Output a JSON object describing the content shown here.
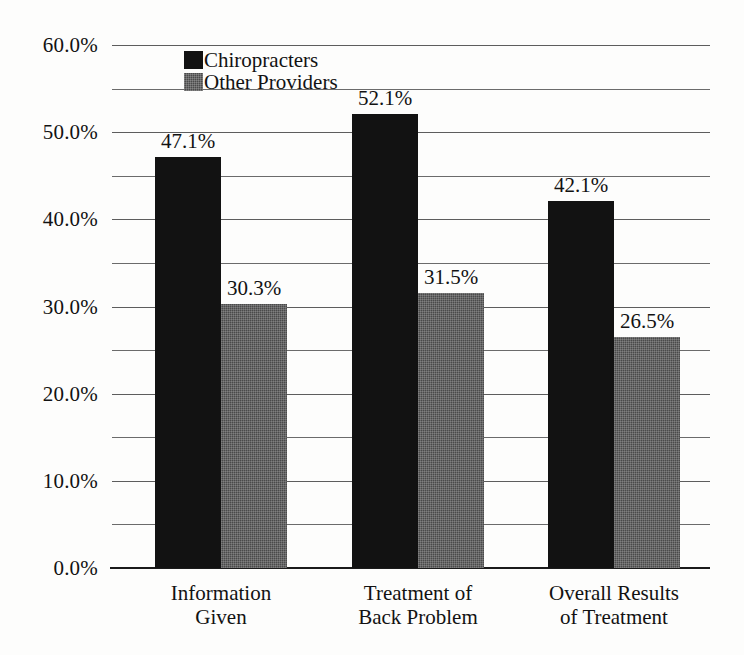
{
  "chart_data": {
    "type": "bar",
    "title": "",
    "subtitle": "",
    "xlabel": "",
    "ylabel": "",
    "ylim": [
      0,
      60
    ],
    "ytick_labels": [
      "0.0%",
      "10.0%",
      "20.0%",
      "30.0%",
      "40.0%",
      "50.0%",
      "60.0%"
    ],
    "ytick_values": [
      0,
      10,
      20,
      30,
      40,
      50,
      60
    ],
    "minor_gridline_values": [
      5,
      15,
      25,
      35,
      45,
      55
    ],
    "grid": "horizontal",
    "legend_position": "top-left-inside",
    "categories": [
      "Information Given",
      "Treatment of Back Problem",
      "Overall Results of Treatment"
    ],
    "category_lines": [
      [
        "Information",
        "Given"
      ],
      [
        "Treatment of",
        "Back Problem"
      ],
      [
        "Overall Results",
        "of Treatment"
      ]
    ],
    "series": [
      {
        "name": "Chiropracters",
        "color": "#121212",
        "values": [
          47.1,
          52.1,
          42.1
        ],
        "labels": [
          "47.1%",
          "52.1%",
          "42.1%"
        ]
      },
      {
        "name": "Other Providers",
        "color": "#4a4a4a",
        "values": [
          30.3,
          31.5,
          26.5
        ],
        "labels": [
          "30.3%",
          "31.5%",
          "26.5%"
        ]
      }
    ]
  }
}
